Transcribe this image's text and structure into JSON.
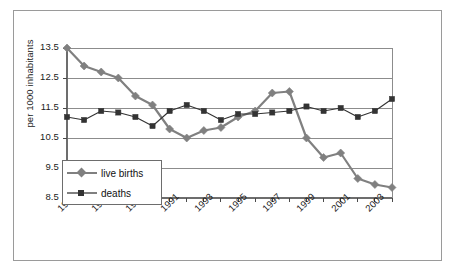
{
  "chart_data": {
    "type": "line",
    "title": "",
    "xlabel": "",
    "ylabel": "per 1000 inhabitants",
    "ylim": [
      8.5,
      13.5
    ],
    "yticks": [
      "13.5",
      "12.5",
      "11.5",
      "10.5",
      "9.5",
      "8.5"
    ],
    "ytick_values": [
      13.5,
      12.5,
      11.5,
      10.5,
      9.5,
      8.5
    ],
    "grid": true,
    "legend_position": "inside-lower-left",
    "x": [
      1985,
      1986,
      1987,
      1988,
      1989,
      1990,
      1991,
      1992,
      1993,
      1994,
      1995,
      1996,
      1997,
      1998,
      1999,
      2000,
      2001,
      2002,
      2003,
      2004
    ],
    "xtick_labels": [
      "1985",
      "1987",
      "1989",
      "1991",
      "1993",
      "1995",
      "1997",
      "1999",
      "2001",
      "2003"
    ],
    "xtick_values": [
      1985,
      1987,
      1989,
      1991,
      1993,
      1995,
      1997,
      1999,
      2001,
      2003
    ],
    "series": [
      {
        "name": "live births",
        "marker": "diamond",
        "color": "#808080",
        "values": [
          13.5,
          12.9,
          12.7,
          12.5,
          11.9,
          11.6,
          10.8,
          10.5,
          10.75,
          10.85,
          11.2,
          11.4,
          12.0,
          12.05,
          10.5,
          9.85,
          10.0,
          9.15,
          8.95,
          8.85
        ]
      },
      {
        "name": "deaths",
        "marker": "square",
        "color": "#333333",
        "values": [
          11.2,
          11.1,
          11.4,
          11.35,
          11.2,
          10.9,
          11.4,
          11.6,
          11.4,
          11.1,
          11.3,
          11.3,
          11.35,
          11.4,
          11.55,
          11.4,
          11.5,
          11.2,
          11.4,
          11.8
        ]
      }
    ]
  },
  "legend": {
    "items": [
      {
        "label": "live births"
      },
      {
        "label": "deaths"
      }
    ]
  }
}
